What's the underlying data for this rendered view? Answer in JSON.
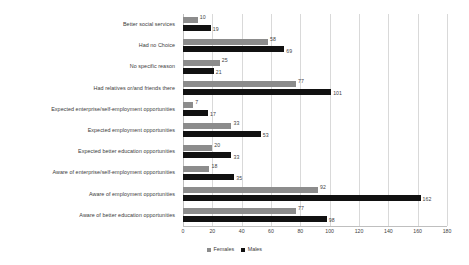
{
  "chart_data": {
    "type": "bar",
    "orientation": "horizontal",
    "title": "",
    "subtitle": "",
    "xlabel": "",
    "ylabel": "",
    "xlim": [
      0,
      180
    ],
    "xticks": [
      0,
      20,
      40,
      60,
      80,
      100,
      120,
      140,
      160,
      180
    ],
    "grid": true,
    "grid_axis": "x",
    "legend_position": "bottom-center",
    "categories": [
      "Better social services",
      "Had no Choice",
      "No specific reason",
      "Had relatives or/and friends there",
      "Expected enterprise/self-employment opportunities",
      "Expected employment opportunities",
      "Expected better education opportunities",
      "Aware of enterprise/self-employment opportunities",
      "Aware of employment opportunities",
      "Aware of better education opportunities"
    ],
    "series": [
      {
        "name": "Females",
        "color": "#8c8c8c",
        "values": [
          10,
          58,
          25,
          77,
          7,
          33,
          20,
          18,
          92,
          77
        ]
      },
      {
        "name": "Males",
        "color": "#111111",
        "values": [
          19,
          69,
          21,
          101,
          17,
          53,
          33,
          35,
          162,
          98
        ]
      }
    ]
  },
  "legend": {
    "items": [
      {
        "label": "Females",
        "color": "#8c8c8c"
      },
      {
        "label": "Males",
        "color": "#111111"
      }
    ]
  }
}
